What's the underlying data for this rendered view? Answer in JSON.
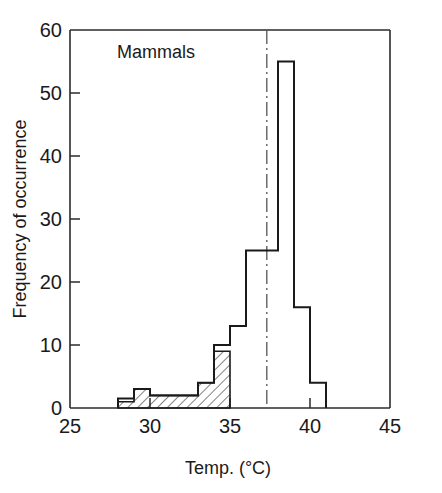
{
  "figure": {
    "panel_label": "Mammals",
    "background_color": "#ffffff",
    "line_color": "#1a1a1a"
  },
  "axes": {
    "x_title": "Temp. (°C)",
    "y_title": "Frequency of occurrence",
    "x_ticks": [
      "25",
      "30",
      "35",
      "40",
      "45"
    ],
    "y_ticks": [
      "0",
      "10",
      "20",
      "30",
      "40",
      "50",
      "60"
    ]
  },
  "chart_data": {
    "type": "bar",
    "title": "Mammals",
    "xlabel": "Temp. (°C)",
    "ylabel": "Frequency of occurrence",
    "xlim": [
      25,
      45
    ],
    "ylim": [
      0,
      60
    ],
    "xticks": [
      25,
      30,
      35,
      40,
      45
    ],
    "yticks": [
      0,
      10,
      20,
      30,
      40,
      50,
      60
    ],
    "grid": false,
    "legend": false,
    "bin_width": 1,
    "bin_edges": [
      28,
      29,
      30,
      31,
      32,
      33,
      34,
      35,
      36,
      37,
      38,
      39,
      40,
      41
    ],
    "categories": [
      "28-29",
      "29-30",
      "30-31",
      "31-32",
      "32-33",
      "33-34",
      "34-35",
      "35-36",
      "36-37",
      "37-38",
      "38-39",
      "39-40",
      "40-41"
    ],
    "series": [
      {
        "name": "total",
        "fill": "none",
        "values": [
          1.5,
          3,
          2,
          2,
          2,
          4,
          10,
          13,
          25,
          25,
          55,
          16,
          4
        ]
      },
      {
        "name": "hatched subset",
        "fill": "diagonal-hatch",
        "values": [
          1,
          3,
          2,
          2,
          2,
          4,
          9,
          0,
          0,
          0,
          0,
          0,
          0
        ]
      }
    ],
    "annotations": [
      {
        "type": "vertical-dash-dot-line",
        "x": 37.3,
        "label": ""
      }
    ]
  }
}
